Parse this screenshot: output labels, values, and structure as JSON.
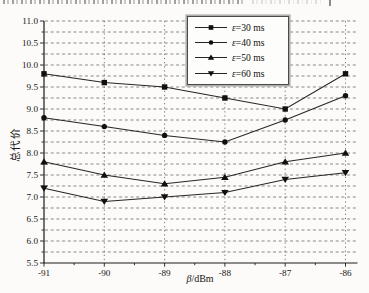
{
  "page": {
    "background": "#fcfbf9",
    "has_clipped_text_top": true
  },
  "chart_data": {
    "type": "line",
    "title": "",
    "xlabel": "β/dBm",
    "xlabel_sym": "β",
    "xlabel_rest": "/dBm",
    "ylabel": "总代价",
    "x": [
      -91,
      -90,
      -89,
      -88,
      -87,
      -86
    ],
    "x_tick_labels": [
      "-91",
      "-90",
      "-89",
      "-88",
      "-87",
      "-86"
    ],
    "y_tick_labels": [
      "5.5",
      "6.0",
      "6.5",
      "7.0",
      "7.5",
      "8.0",
      "8.5",
      "9.0",
      "9.5",
      "10.0",
      "10.5",
      "11.0"
    ],
    "xlim": [
      -91,
      -86
    ],
    "ylim": [
      5.5,
      11.0
    ],
    "y_major_step": 0.5,
    "y_minor_step": 0.25,
    "grid": "dashed horizontal lines every 0.25; dashed vertical lines at each x tick",
    "legend_position": "top-center",
    "line_color": "#262626",
    "marker_color": "#101010",
    "series": [
      {
        "name": "ε=30 ms",
        "marker": "square",
        "values": [
          9.8,
          9.6,
          9.5,
          9.25,
          9.0,
          9.8
        ]
      },
      {
        "name": "ε=40 ms",
        "marker": "circle",
        "values": [
          8.8,
          8.6,
          8.4,
          8.25,
          8.75,
          9.3
        ]
      },
      {
        "name": "ε=50 ms",
        "marker": "triangle-up",
        "values": [
          7.8,
          7.5,
          7.3,
          7.45,
          7.8,
          8.0
        ]
      },
      {
        "name": "ε=60 ms",
        "marker": "triangle-down",
        "values": [
          7.2,
          6.9,
          7.0,
          7.1,
          7.4,
          7.55
        ]
      }
    ]
  }
}
